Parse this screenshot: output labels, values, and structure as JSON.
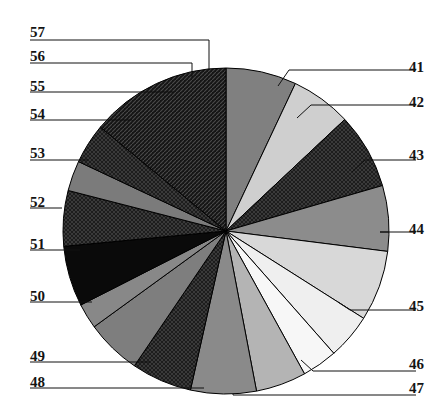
{
  "figure": {
    "type": "pie-chart-figure",
    "background": "#ffffff",
    "center": {
      "x": 226,
      "y": 231
    },
    "radius": 163
  },
  "chart_data": {
    "type": "pie",
    "title": "",
    "subtitle": "",
    "xlabel": "",
    "ylabel": "",
    "grid": false,
    "legend_position": "callout-leader-lines",
    "start_angle_deg": 0,
    "direction": "clockwise",
    "categories": [
      "41",
      "42",
      "43",
      "44",
      "45",
      "46",
      "47",
      "48",
      "49",
      "50",
      "51",
      "52",
      "53",
      "54",
      "55",
      "56",
      "57"
    ],
    "values": [
      7.0,
      6.0,
      7.5,
      6.5,
      7.0,
      4.5,
      3.5,
      5.0,
      6.5,
      6.0,
      5.5,
      2.5,
      6.0,
      5.5,
      3.0,
      4.0,
      14.0
    ],
    "units": "percent",
    "slices": [
      {
        "label": "41",
        "value": 7.0,
        "start_deg": 0.0,
        "end_deg": 25.2,
        "fill": "#808080",
        "pattern": "solid",
        "side": "right",
        "label_y": 60
      },
      {
        "label": "42",
        "value": 6.0,
        "start_deg": 25.2,
        "end_deg": 46.8,
        "fill": "#cfcfcf",
        "pattern": "solid",
        "side": "right",
        "label_y": 95
      },
      {
        "label": "43",
        "value": 7.5,
        "start_deg": 46.8,
        "end_deg": 73.8,
        "fill": "#3a3a3a",
        "pattern": "crosshatch",
        "side": "right",
        "label_y": 148
      },
      {
        "label": "44",
        "value": 6.5,
        "start_deg": 73.8,
        "end_deg": 97.2,
        "fill": "#8c8c8c",
        "pattern": "solid",
        "side": "right",
        "label_y": 222
      },
      {
        "label": "45",
        "value": 7.0,
        "start_deg": 97.2,
        "end_deg": 122.4,
        "fill": "#d8d8d8",
        "pattern": "solid",
        "side": "right",
        "label_y": 299
      },
      {
        "label": "46",
        "value": 4.5,
        "start_deg": 122.4,
        "end_deg": 138.6,
        "fill": "#efefef",
        "pattern": "solid",
        "side": "right",
        "label_y": 357
      },
      {
        "label": "47",
        "value": 3.5,
        "start_deg": 138.6,
        "end_deg": 151.2,
        "fill": "#f7f7f7",
        "pattern": "solid",
        "side": "right",
        "label_y": 381
      },
      {
        "label": "48",
        "value": 5.0,
        "start_deg": 151.2,
        "end_deg": 169.2,
        "fill": "#b4b4b4",
        "pattern": "solid",
        "side": "left",
        "label_y": 375
      },
      {
        "label": "49",
        "value": 6.5,
        "start_deg": 169.2,
        "end_deg": 192.6,
        "fill": "#8a8a8a",
        "pattern": "solid",
        "side": "left",
        "label_y": 349
      },
      {
        "label": "50",
        "value": 6.0,
        "start_deg": 192.6,
        "end_deg": 214.2,
        "fill": "#3c3c3c",
        "pattern": "crosshatch",
        "side": "left",
        "label_y": 289
      },
      {
        "label": "51",
        "value": 5.5,
        "start_deg": 214.2,
        "end_deg": 234.0,
        "fill": "#7e7e7e",
        "pattern": "solid",
        "side": "left",
        "label_y": 237
      },
      {
        "label": "52",
        "value": 2.5,
        "start_deg": 234.0,
        "end_deg": 243.0,
        "fill": "#888888",
        "pattern": "solid",
        "side": "left",
        "label_y": 195
      },
      {
        "label": "53",
        "value": 6.0,
        "start_deg": 243.0,
        "end_deg": 264.6,
        "fill": "#0a0a0a",
        "pattern": "solid",
        "side": "left",
        "label_y": 146
      },
      {
        "label": "54",
        "value": 5.5,
        "start_deg": 264.6,
        "end_deg": 284.4,
        "fill": "#404040",
        "pattern": "crosshatch",
        "side": "left",
        "label_y": 107
      },
      {
        "label": "55",
        "value": 3.0,
        "start_deg": 284.4,
        "end_deg": 295.2,
        "fill": "#7b7b7b",
        "pattern": "solid",
        "side": "left",
        "label_y": 79
      },
      {
        "label": "56",
        "value": 4.0,
        "start_deg": 295.2,
        "end_deg": 309.6,
        "fill": "#2e2e2e",
        "pattern": "crosshatch",
        "side": "left",
        "label_y": 49
      },
      {
        "label": "57",
        "value": 14.0,
        "start_deg": 309.6,
        "end_deg": 360.0,
        "fill": "#181818",
        "pattern": "diagonal",
        "side": "left",
        "label_y": 25
      }
    ],
    "leaders": [
      {
        "label": "41",
        "points": "416,70 289,70 278,86"
      },
      {
        "label": "42",
        "points": "416,105 311,105 297,118"
      },
      {
        "label": "43",
        "points": "416,160 365,160 352,172"
      },
      {
        "label": "44",
        "points": "416,232 380,232 389,232"
      },
      {
        "label": "45",
        "points": "416,310 350,310 338,302"
      },
      {
        "label": "46",
        "points": "416,371 313,371 301,360"
      },
      {
        "label": "47",
        "points": "416,395 233,395 233,394"
      },
      {
        "label": "48",
        "points": "30,388 204,388"
      },
      {
        "label": "49",
        "points": "30,362 150,362"
      },
      {
        "label": "50",
        "points": "30,302 92,302"
      },
      {
        "label": "51",
        "points": "30,250 80,250"
      },
      {
        "label": "52",
        "points": "30,208 62,208"
      },
      {
        "label": "53",
        "points": "30,160 88,160"
      },
      {
        "label": "54",
        "points": "30,120 132,120"
      },
      {
        "label": "55",
        "points": "30,92 174,92"
      },
      {
        "label": "56",
        "points": "30,63 192,63 192,78"
      },
      {
        "label": "57",
        "points": "30,40 209,40 209,70"
      }
    ]
  },
  "labels": {
    "left": [
      "57",
      "56",
      "55",
      "54",
      "53",
      "52",
      "51",
      "50",
      "49",
      "48"
    ],
    "right": [
      "41",
      "42",
      "43",
      "44",
      "45",
      "46",
      "47"
    ]
  }
}
